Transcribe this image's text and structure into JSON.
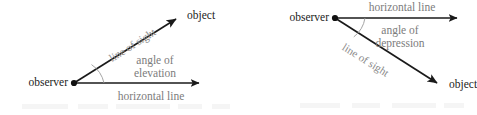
{
  "figure": {
    "background_color": "#ffffff",
    "line_color": "#1a1a1a",
    "dark_text_color": "#1c1c1c",
    "gray_text_color": "#7c7c7c",
    "arc_color": "#9a9a9a"
  },
  "diagrams": [
    {
      "name": "angle-of-elevation",
      "vertex_label": "observer",
      "target_label": "object",
      "ray_label": "line of sight",
      "angle_label_line1": "angle of",
      "angle_label_line2": "elevation",
      "baseline_label": "horizontal line"
    },
    {
      "name": "angle-of-depression",
      "vertex_label": "observer",
      "target_label": "object",
      "ray_label": "line of sight",
      "angle_label_line1": "angle of",
      "angle_label_line2": "depression",
      "baseline_label": "horizontal line"
    }
  ]
}
